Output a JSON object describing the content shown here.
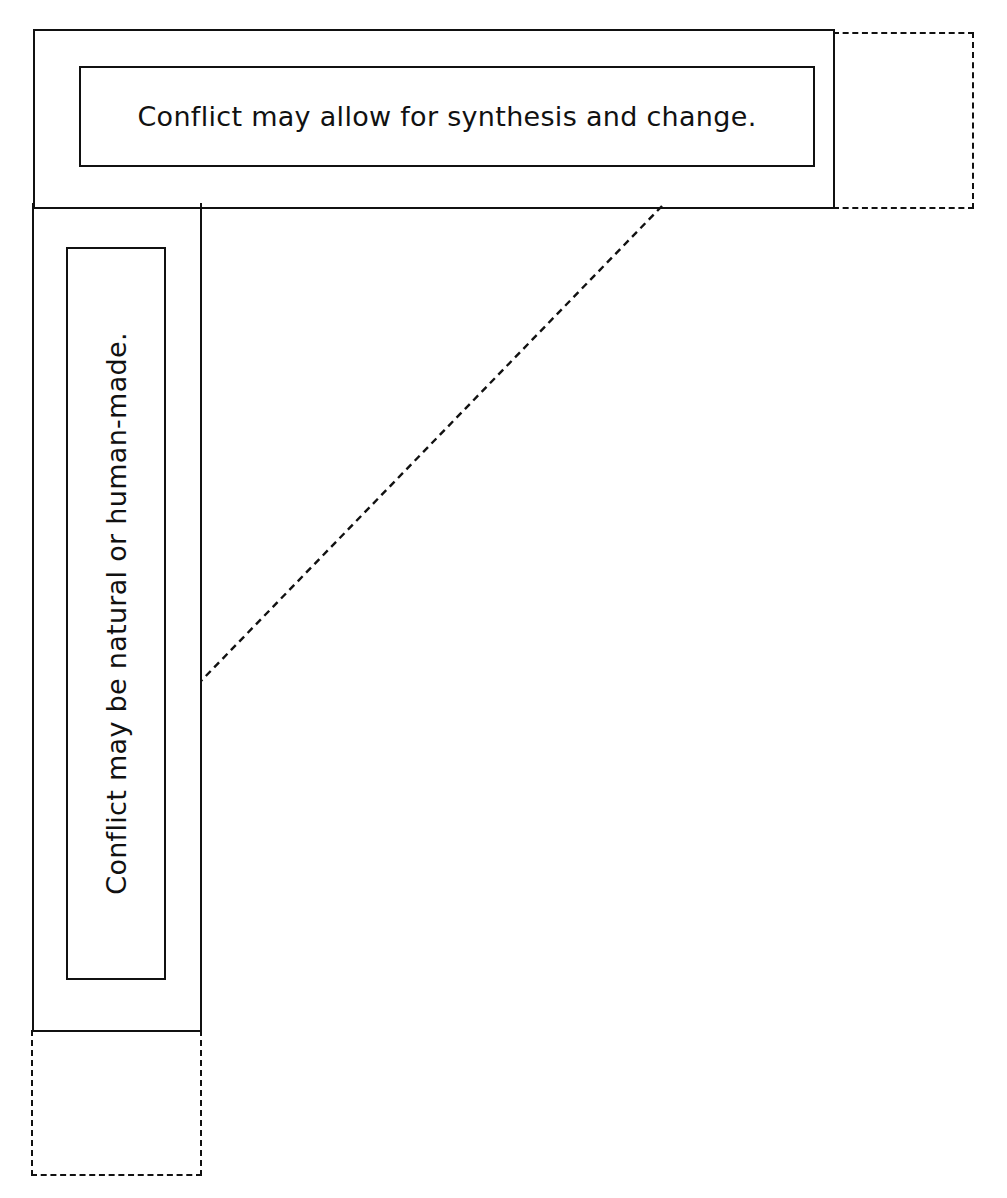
{
  "diagram": {
    "top_panel": {
      "label": "Conflict may allow for synthesis and change."
    },
    "left_panel": {
      "label": "Conflict may be natural or human-made."
    },
    "connector": {
      "style": "dashed",
      "from": "top-panel-bottom-edge",
      "to": "left-panel-right-edge"
    },
    "placeholders": [
      {
        "position": "top-right",
        "style": "dashed"
      },
      {
        "position": "bottom-left",
        "style": "dashed"
      }
    ],
    "colors": {
      "stroke": "#111111",
      "background": "#ffffff"
    }
  }
}
